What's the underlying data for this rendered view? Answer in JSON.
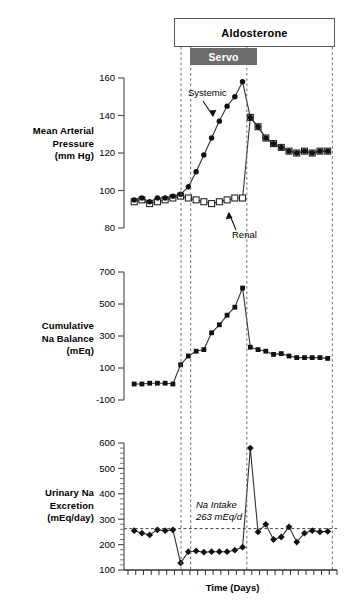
{
  "figure": {
    "treatment_bar": {
      "label": "Aldosterone"
    },
    "servo_bar": {
      "label": "Servo"
    },
    "x_axis_title": "Time (Days)",
    "accent_color": "#6d6d6d",
    "line_color": "#333333"
  },
  "panels": {
    "top": {
      "axis_title_lines": [
        "Mean Arterial",
        "Pressure",
        "(mm Hg)"
      ],
      "ticks": [
        "160",
        "140",
        "120",
        "100",
        "80"
      ],
      "annotations": [
        {
          "name": "systemic-label",
          "text": "Systemic"
        },
        {
          "name": "renal-label",
          "text": "Renal"
        }
      ]
    },
    "middle": {
      "axis_title_lines": [
        "Cumulative",
        "Na Balance",
        "(mEq)"
      ],
      "ticks": [
        "700",
        "500",
        "300",
        "100",
        "-100"
      ]
    },
    "bottom": {
      "axis_title_lines": [
        "Urinary Na",
        "Excretion",
        "(mEq/day)"
      ],
      "ticks": [
        "600",
        "500",
        "400",
        "300",
        "200",
        "100"
      ],
      "annotations": [
        {
          "name": "na-intake-label-line1",
          "text": "Na Intake"
        },
        {
          "name": "na-intake-label-line2",
          "text": "263 mEq/d"
        }
      ]
    }
  },
  "chart_data": [
    {
      "type": "line",
      "name": "mean-arterial-pressure",
      "title": "Mean Arterial Pressure (mm Hg)",
      "xlabel": "Time (Days)",
      "ylabel": "Mean Arterial Pressure (mm Hg)",
      "ylim": [
        80,
        160
      ],
      "xlim": [
        0,
        27
      ],
      "grid": false,
      "legend": [
        "Systemic",
        "Renal"
      ],
      "x": [
        1,
        2,
        3,
        4,
        5,
        6,
        7,
        8,
        9,
        10,
        11,
        12,
        13,
        14,
        15,
        16,
        17,
        18,
        19,
        20,
        21,
        22,
        23,
        24,
        25,
        26
      ],
      "series": [
        {
          "name": "Systemic",
          "marker": "filled-circle",
          "values": [
            95,
            96,
            94,
            96,
            96,
            97,
            98,
            102,
            110,
            119,
            128,
            137,
            145,
            150,
            158,
            139,
            134,
            128,
            125,
            123,
            121,
            120,
            121,
            120,
            121,
            121
          ]
        },
        {
          "name": "Renal",
          "marker": "open-square",
          "values": [
            94,
            95,
            93,
            94,
            95,
            96,
            97,
            96,
            95,
            94,
            93,
            94,
            95,
            96,
            96,
            139,
            134,
            128,
            125,
            123,
            121,
            120,
            121,
            120,
            121,
            121
          ]
        }
      ]
    },
    {
      "type": "line",
      "name": "cumulative-na-balance",
      "title": "Cumulative Na Balance (mEq)",
      "xlabel": "Time (Days)",
      "ylabel": "Cumulative Na Balance (mEq)",
      "ylim": [
        -100,
        700
      ],
      "xlim": [
        0,
        27
      ],
      "grid": false,
      "x": [
        1,
        2,
        3,
        4,
        5,
        6,
        7,
        8,
        9,
        10,
        11,
        12,
        13,
        14,
        15,
        16,
        17,
        18,
        19,
        20,
        21,
        22,
        23,
        24,
        25,
        26
      ],
      "values": [
        0,
        0,
        5,
        5,
        5,
        0,
        120,
        175,
        205,
        215,
        320,
        370,
        430,
        480,
        600,
        230,
        215,
        205,
        185,
        190,
        175,
        165,
        165,
        165,
        165,
        160
      ]
    },
    {
      "type": "line",
      "name": "urinary-na-excretion",
      "title": "Urinary Na Excretion (mEq/day)",
      "xlabel": "Time (Days)",
      "ylabel": "Urinary Na Excretion (mEq/day)",
      "ylim": [
        100,
        600
      ],
      "xlim": [
        0,
        27
      ],
      "grid": false,
      "reference_line": {
        "value": 263,
        "label": "Na Intake 263 mEq/d",
        "style": "dashed"
      },
      "x": [
        1,
        2,
        3,
        4,
        5,
        6,
        7,
        8,
        9,
        10,
        11,
        12,
        13,
        14,
        15,
        16,
        17,
        18,
        19,
        20,
        21,
        22,
        23,
        24,
        25,
        26
      ],
      "values": [
        255,
        245,
        238,
        258,
        255,
        258,
        128,
        172,
        175,
        170,
        172,
        172,
        172,
        178,
        190,
        580,
        250,
        280,
        220,
        230,
        270,
        210,
        245,
        255,
        250,
        252
      ]
    }
  ]
}
